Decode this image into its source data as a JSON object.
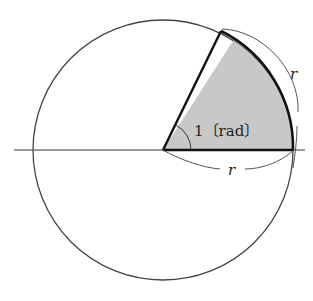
{
  "diagram": {
    "angle_label": "1〔rad〕",
    "arc_label": "r",
    "radius_label": "r",
    "circle": {
      "cx": 163,
      "cy": 150,
      "r": 130
    },
    "sector_angle_deg": 57.3,
    "colors": {
      "stroke": "#333333",
      "sector_fill": "#c8c8c8",
      "background": "#ffffff"
    }
  }
}
